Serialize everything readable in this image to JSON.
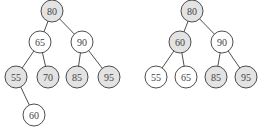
{
  "colors": {
    "highlight_fill": "#e3e3e3",
    "normal_fill": "#ffffff",
    "stroke": "#3a3a3a"
  },
  "trees": [
    {
      "name": "tree-before",
      "nodes": [
        {
          "id": "a80",
          "label": "80",
          "x": 52,
          "y": 11,
          "highlight": true
        },
        {
          "id": "a65",
          "label": "65",
          "x": 40,
          "y": 42,
          "highlight": false
        },
        {
          "id": "a90",
          "label": "90",
          "x": 82,
          "y": 42,
          "highlight": false
        },
        {
          "id": "a55",
          "label": "55",
          "x": 16,
          "y": 77,
          "highlight": true
        },
        {
          "id": "a70",
          "label": "70",
          "x": 48,
          "y": 77,
          "highlight": true
        },
        {
          "id": "a85",
          "label": "85",
          "x": 77,
          "y": 77,
          "highlight": true
        },
        {
          "id": "a95",
          "label": "95",
          "x": 109,
          "y": 77,
          "highlight": true
        },
        {
          "id": "a60",
          "label": "60",
          "x": 34,
          "y": 115,
          "highlight": false
        }
      ],
      "edges": [
        [
          "a80",
          "a65"
        ],
        [
          "a80",
          "a90"
        ],
        [
          "a65",
          "a55"
        ],
        [
          "a65",
          "a70"
        ],
        [
          "a90",
          "a85"
        ],
        [
          "a90",
          "a95"
        ],
        [
          "a55",
          "a60"
        ]
      ]
    },
    {
      "name": "tree-after",
      "nodes": [
        {
          "id": "b80",
          "label": "80",
          "x": 192,
          "y": 11,
          "highlight": true
        },
        {
          "id": "b60",
          "label": "60",
          "x": 180,
          "y": 42,
          "highlight": true
        },
        {
          "id": "b90",
          "label": "90",
          "x": 222,
          "y": 42,
          "highlight": false
        },
        {
          "id": "b55",
          "label": "55",
          "x": 156,
          "y": 77,
          "highlight": false
        },
        {
          "id": "b65",
          "label": "65",
          "x": 186,
          "y": 77,
          "highlight": false
        },
        {
          "id": "b85",
          "label": "85",
          "x": 216,
          "y": 77,
          "highlight": true
        },
        {
          "id": "b95",
          "label": "95",
          "x": 246,
          "y": 77,
          "highlight": true
        }
      ],
      "edges": [
        [
          "b80",
          "b60"
        ],
        [
          "b80",
          "b90"
        ],
        [
          "b60",
          "b55"
        ],
        [
          "b60",
          "b65"
        ],
        [
          "b90",
          "b85"
        ],
        [
          "b90",
          "b95"
        ]
      ]
    }
  ],
  "node_radius": 11
}
